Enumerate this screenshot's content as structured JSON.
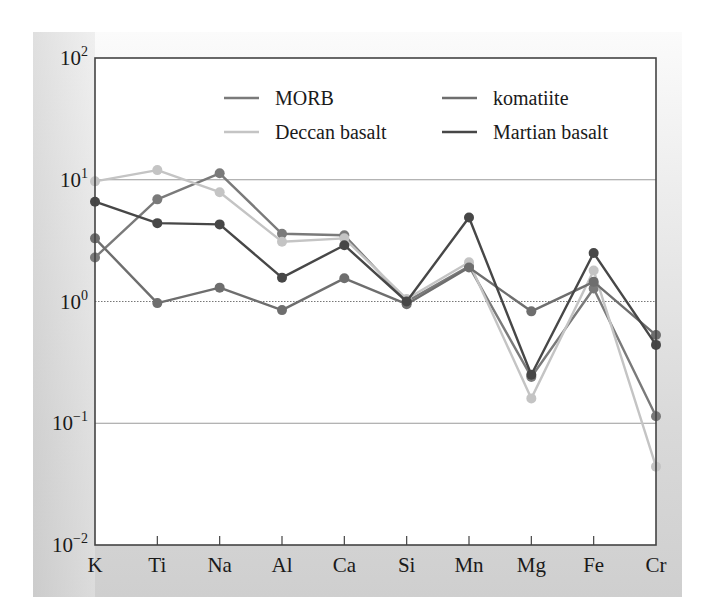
{
  "chart_data": {
    "type": "line",
    "title": "",
    "xlabel": "",
    "ylabel": "",
    "yscale": "log",
    "ylim": [
      0.01,
      100
    ],
    "grid": true,
    "legend_position": "upper right (inside, 2 columns)",
    "categories": [
      "K",
      "Ti",
      "Na",
      "Al",
      "Ca",
      "Si",
      "Mn",
      "Mg",
      "Fe",
      "Cr"
    ],
    "y_ticks": [
      {
        "base": "10",
        "exp": "2",
        "value": 100
      },
      {
        "base": "10",
        "exp": "1",
        "value": 10
      },
      {
        "base": "10",
        "exp": "0",
        "value": 1
      },
      {
        "base": "10",
        "exp": "−1",
        "value": 0.1
      },
      {
        "base": "10",
        "exp": "−2",
        "value": 0.01
      }
    ],
    "series": [
      {
        "name": "MORB",
        "color": "#7a7a7a",
        "values": [
          2.3,
          6.9,
          11.3,
          3.6,
          3.5,
          1.0,
          1.95,
          0.24,
          1.28,
          0.114
        ]
      },
      {
        "name": "Deccan basalt",
        "color": "#c4c4c4",
        "values": [
          9.7,
          12.0,
          7.9,
          3.1,
          3.3,
          1.05,
          2.1,
          0.16,
          1.8,
          0.044
        ]
      },
      {
        "name": "komatiite",
        "color": "#6e6e6e",
        "values": [
          3.3,
          0.97,
          1.3,
          0.85,
          1.55,
          0.95,
          1.9,
          0.83,
          1.45,
          0.53
        ]
      },
      {
        "name": "Martian basalt",
        "color": "#474747",
        "values": [
          6.6,
          4.4,
          4.3,
          1.57,
          2.9,
          1.0,
          4.9,
          0.25,
          2.5,
          0.44
        ]
      }
    ]
  },
  "legend": {
    "items": [
      {
        "label": "MORB",
        "color": "#7a7a7a"
      },
      {
        "label": "komatiite",
        "color": "#6e6e6e"
      },
      {
        "label": "Deccan basalt",
        "color": "#c4c4c4"
      },
      {
        "label": "Martian basalt",
        "color": "#474747"
      }
    ]
  }
}
